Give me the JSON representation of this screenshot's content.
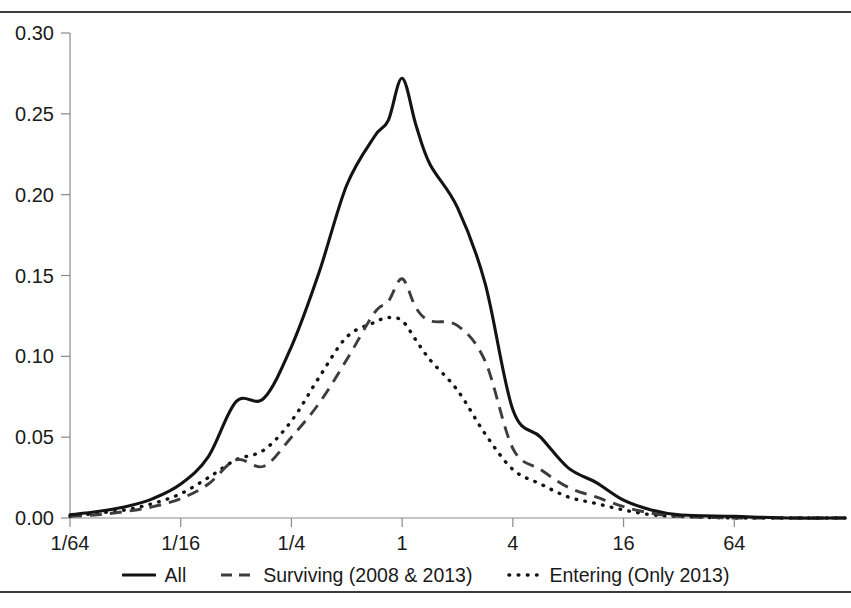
{
  "figure": {
    "title": "",
    "has_top_rule": true,
    "has_bottom_rule": true,
    "background": "#ffffff",
    "foreground": "#1a1a1a"
  },
  "legend": {
    "position": "bottom-center",
    "items": [
      {
        "label": "All",
        "style": "solid",
        "color": "#131313",
        "icon": "solid-line-swatch"
      },
      {
        "label": "Surviving (2008 & 2013)",
        "style": "dashed",
        "color": "#3d3d3d",
        "icon": "dashed-line-swatch"
      },
      {
        "label": "Entering (Only 2013)",
        "style": "dotted",
        "color": "#131313",
        "icon": "dotted-line-swatch"
      }
    ]
  },
  "axes": {
    "y_ticks": [
      "0.00",
      "0.05",
      "0.10",
      "0.15",
      "0.20",
      "0.25",
      "0.30"
    ],
    "y_values": [
      0.0,
      0.05,
      0.1,
      0.15,
      0.2,
      0.25,
      0.3
    ],
    "x_ticks": [
      "1/64",
      "1/16",
      "1/4",
      "1",
      "4",
      "16",
      "64"
    ],
    "x_values": [
      0.015625,
      0.0625,
      0.25,
      1,
      4,
      16,
      64
    ]
  },
  "chart_data": {
    "type": "line",
    "title": "",
    "xlabel": "",
    "ylabel": "",
    "xscale": "log4",
    "xlim": [
      0.015625,
      256
    ],
    "ylim": [
      0.0,
      0.3
    ],
    "grid": false,
    "legend_position": "bottom-center",
    "xtick_labels": [
      "1/64",
      "1/16",
      "1/4",
      "1",
      "4",
      "16",
      "64"
    ],
    "xtick_values": [
      0.015625,
      0.0625,
      0.25,
      1,
      4,
      16,
      64
    ],
    "ytick_labels": [
      "0.00",
      "0.05",
      "0.10",
      "0.15",
      "0.20",
      "0.25",
      "0.30"
    ],
    "ytick_values": [
      0.0,
      0.05,
      0.1,
      0.15,
      0.2,
      0.25,
      0.3
    ],
    "x": [
      0.015625,
      0.0221,
      0.0313,
      0.0442,
      0.0625,
      0.0884,
      0.125,
      0.1768,
      0.25,
      0.3536,
      0.5,
      0.7071,
      0.8409,
      1.0,
      1.1892,
      1.4142,
      2.0,
      2.8284,
      4.0,
      5.6569,
      8.0,
      11.3137,
      16.0,
      22.627,
      32.0,
      64.0,
      128.0,
      256.0
    ],
    "series": [
      {
        "name": "All",
        "style": "solid",
        "color": "#131313",
        "values": [
          0.002,
          0.004,
          0.007,
          0.012,
          0.021,
          0.038,
          0.072,
          0.074,
          0.106,
          0.152,
          0.206,
          0.236,
          0.246,
          0.272,
          0.243,
          0.219,
          0.192,
          0.145,
          0.067,
          0.05,
          0.031,
          0.022,
          0.011,
          0.005,
          0.002,
          0.001,
          0.0,
          0.0
        ],
        "peak": {
          "x": 1.0,
          "y": 0.272
        }
      },
      {
        "name": "Surviving (2008 & 2013)",
        "style": "dashed",
        "color": "#3d3d3d",
        "values": [
          0.001,
          0.002,
          0.004,
          0.007,
          0.012,
          0.021,
          0.036,
          0.032,
          0.05,
          0.071,
          0.098,
          0.127,
          0.134,
          0.148,
          0.13,
          0.122,
          0.119,
          0.097,
          0.043,
          0.03,
          0.019,
          0.013,
          0.007,
          0.003,
          0.001,
          0.0,
          0.0,
          0.0
        ],
        "peak": {
          "x": 1.0,
          "y": 0.148
        }
      },
      {
        "name": "Entering (Only 2013)",
        "style": "dotted",
        "color": "#131313",
        "values": [
          0.001,
          0.003,
          0.005,
          0.009,
          0.015,
          0.025,
          0.036,
          0.042,
          0.06,
          0.087,
          0.112,
          0.121,
          0.124,
          0.122,
          0.11,
          0.098,
          0.079,
          0.052,
          0.03,
          0.021,
          0.013,
          0.009,
          0.005,
          0.002,
          0.001,
          0.0,
          0.0,
          0.0
        ],
        "peak": {
          "x": 0.8409,
          "y": 0.124
        }
      }
    ]
  }
}
